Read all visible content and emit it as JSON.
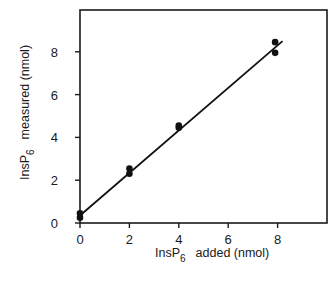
{
  "chart_data": {
    "type": "scatter",
    "title": "",
    "xlabel": "InsP6 added (nmol)",
    "ylabel": "InsP6 measured (nmol)",
    "xlabel_parts": {
      "prefix": "InsP",
      "sub": "6",
      "rest": "added  (nmol)"
    },
    "ylabel_parts": {
      "prefix": "InsP",
      "sub": "6",
      "rest": "measured  (nmol)"
    },
    "xlim": [
      0,
      10
    ],
    "ylim": [
      0,
      10
    ],
    "x_ticks": [
      0,
      2,
      4,
      6,
      8
    ],
    "y_ticks": [
      0,
      2,
      4,
      6,
      8
    ],
    "grid": false,
    "legend": null,
    "series": [
      {
        "name": "measurements",
        "points": [
          {
            "x": 0,
            "y": 0.25
          },
          {
            "x": 0,
            "y": 0.45
          },
          {
            "x": 2,
            "y": 2.3
          },
          {
            "x": 2,
            "y": 2.55
          },
          {
            "x": 4,
            "y": 4.45
          },
          {
            "x": 4,
            "y": 4.55
          },
          {
            "x": 7.9,
            "y": 7.95
          },
          {
            "x": 7.9,
            "y": 8.45
          }
        ]
      }
    ],
    "fit_line": {
      "x0": 0,
      "y0": 0.35,
      "x1": 8.2,
      "y1": 8.5
    }
  }
}
